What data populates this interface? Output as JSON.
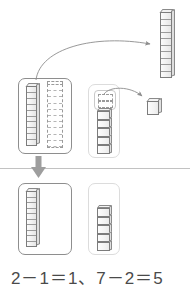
{
  "figure": {
    "title_text": "",
    "equation": "2－1＝1、7－2＝5",
    "colors": {
      "ink": "#4a4a4a",
      "block_outline": "#7c7c7c",
      "box_border_dark": "#8e8e8e",
      "box_border_light": "#dcdcdc",
      "ghost_dashed": "#9a9a9a",
      "arrow_gray": "#8c8c8c",
      "down_arrow": "#9e9e9e",
      "divider": "#c2c2c2",
      "background": "#ffffff"
    }
  },
  "top_row": {
    "tens_group": {
      "name": "tens-group-before",
      "rod_count": 2,
      "solid_rods": 1,
      "ghost_rods": 1,
      "segments_per_rod": 10,
      "label": "tens place: 2 rods, 1 removed"
    },
    "ones_group": {
      "name": "ones-group-before",
      "cube_count": 7,
      "solid_cubes": 5,
      "ghost_cubes": 2,
      "label": "ones place: 7 cubes, 2 removed"
    },
    "removed_rod": {
      "name": "removed-ten-rod",
      "count": 1,
      "segments": 10,
      "label": "1 ten rod taken away"
    },
    "removed_cube": {
      "name": "removed-unit-cube",
      "count": 1,
      "label": "unit cubes taken away"
    },
    "arrow_rod": {
      "name": "curved-arrow-rod",
      "label": "move 1 ten rod out"
    },
    "arrow_cube": {
      "name": "curved-arrow-cube",
      "label": "move 2 unit cubes out"
    }
  },
  "flow": {
    "down_arrow_label": "results in",
    "divider_label": "separator"
  },
  "bottom_row": {
    "tens_group": {
      "name": "tens-group-after",
      "rod_count": 1,
      "segments_per_rod": 10,
      "label": "tens place result: 1 rod"
    },
    "ones_group": {
      "name": "ones-group-after",
      "cube_count": 5,
      "label": "ones place result: 5 cubes"
    }
  },
  "equation_parts": {
    "tens": "2－1＝1",
    "separator": "、",
    "ones": "7－2＝5"
  }
}
